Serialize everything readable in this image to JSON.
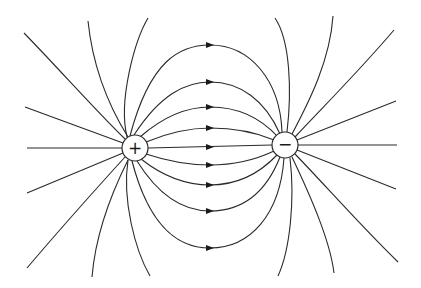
{
  "diagram": {
    "title": "",
    "type": "electric dipole field lines",
    "charges": [
      {
        "name": "positive",
        "symbol": "+",
        "cx": 135,
        "cy": 148,
        "r": 13
      },
      {
        "name": "negative",
        "symbol": "−",
        "cx": 285,
        "cy": 145,
        "r": 13
      }
    ],
    "arrow_direction": "positive-to-negative",
    "arrow_x": 210,
    "connecting_line_arrow_ys": [
      45,
      82,
      107,
      128,
      148,
      165,
      185,
      211,
      248
    ],
    "colors": {
      "line": "#2a2a2a",
      "background": "#ffffff"
    }
  }
}
